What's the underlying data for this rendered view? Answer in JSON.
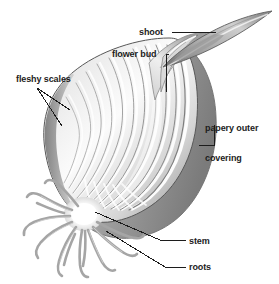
{
  "diagram": {
    "background_color": "#ffffff",
    "text_color": "#1c1c1c",
    "leader_line_color": "#1c1c1c",
    "palette": {
      "outline_dark": "#4a4a4a",
      "scale_mid": "#9a9a9a",
      "scale_light": "#e8e8e8",
      "papery_gray": "#8c8c8c",
      "root_gray": "#a8a8a8",
      "highlight_white": "#ffffff"
    },
    "labels": [
      {
        "id": "shoot",
        "text": "shoot"
      },
      {
        "id": "flower_bud",
        "text": "flower bud"
      },
      {
        "id": "fleshy_scales",
        "text": "fleshy scales"
      },
      {
        "id": "papery_outer_covering",
        "text": "papery outer\ncovering"
      },
      {
        "id": "papery_outer_covering_line1",
        "text": "papery outer"
      },
      {
        "id": "papery_outer_covering_line2",
        "text": "covering"
      },
      {
        "id": "stem",
        "text": "stem"
      },
      {
        "id": "roots",
        "text": "roots"
      }
    ],
    "parts": {
      "shoot": "shoot",
      "flower_bud": "flower bud",
      "fleshy_scales": "fleshy scales",
      "papery_outer_covering_line1": "papery outer",
      "papery_outer_covering_line2": "covering",
      "stem": "stem",
      "roots": "roots"
    }
  }
}
